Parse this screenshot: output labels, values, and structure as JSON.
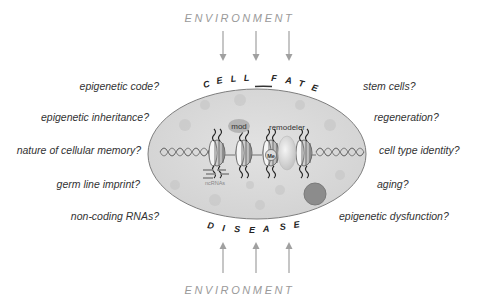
{
  "diagram": {
    "environment_top": "ENVIRONMENT",
    "environment_bottom": "ENVIRONMENT",
    "cell_fate_letters": [
      "C",
      "E",
      "L",
      "L",
      "F",
      "A",
      "T",
      "E"
    ],
    "disease_letters": [
      "D",
      "I",
      "S",
      "E",
      "A",
      "S",
      "E"
    ],
    "cell_fate_label": "CELL FATE",
    "disease_label": "DISEASE",
    "inner_labels": {
      "mod": "mod",
      "remodeler": "remodeler",
      "me": "Me",
      "ncrnas": "ncRNAs"
    },
    "left_questions": [
      "epigenetic code?",
      "epigenetic inheritance?",
      "nature of cellular memory?",
      "germ line imprint?",
      "non-coding RNAs?"
    ],
    "right_questions": [
      "stem cells?",
      "regeneration?",
      "cell type identity?",
      "aging?",
      "epigenetic dysfunction?"
    ],
    "colors": {
      "cell_fill": "#d9d9d9",
      "cell_stroke": "#8a8a8a",
      "arrow": "#9a9a9a",
      "text": "#333333",
      "env_text": "#9a9a9a",
      "blob_dark": "#8c8c8c"
    }
  }
}
